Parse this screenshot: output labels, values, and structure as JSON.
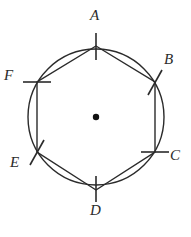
{
  "figure": {
    "kind": "geometry-diagram",
    "canvas": {
      "width": 191,
      "height": 237,
      "background": "#ffffff"
    },
    "stroke_color": "#2b2b2b",
    "circle": {
      "name": "circumscribed-circle",
      "cx": 96,
      "cy": 117,
      "r": 68,
      "stroke_width": 1.4
    },
    "center_point": {
      "name": "center-dot",
      "cx": 96,
      "cy": 117,
      "r": 3.2,
      "fill": "#111111"
    },
    "polygon": {
      "name": "inscribed-hexagon",
      "sides": 6,
      "stroke_width": 1.4,
      "points": "96,46 155,82 155,152 96,190 37,152 37,82"
    },
    "vertices": [
      {
        "id": "A",
        "label": "A",
        "x": 96,
        "y": 46,
        "tick_angle": 90,
        "tick_len": 15,
        "label_x": 90,
        "label_y": 8
      },
      {
        "id": "B",
        "label": "B",
        "x": 155,
        "y": 82,
        "tick_angle": 60,
        "tick_len": 15,
        "label_x": 164,
        "label_y": 52
      },
      {
        "id": "C",
        "label": "C",
        "x": 155,
        "y": 152,
        "tick_angle": 0,
        "tick_len": 15,
        "label_x": 170,
        "label_y": 148
      },
      {
        "id": "D",
        "label": "D",
        "x": 96,
        "y": 190,
        "tick_angle": 90,
        "tick_len": 15,
        "label_x": 90,
        "label_y": 203
      },
      {
        "id": "E",
        "label": "E",
        "x": 37,
        "y": 152,
        "tick_angle": 60,
        "tick_len": 15,
        "label_x": 10,
        "label_y": 155
      },
      {
        "id": "F",
        "label": "F",
        "x": 37,
        "y": 82,
        "tick_angle": 0,
        "tick_len": 15,
        "label_x": 4,
        "label_y": 68
      }
    ],
    "tick_marks": [
      {
        "name": "tick-A",
        "x1": 96,
        "y1": 33,
        "x2": 96,
        "y2": 60
      },
      {
        "name": "tick-B",
        "x1": 162,
        "y1": 70,
        "x2": 148,
        "y2": 95
      },
      {
        "name": "tick-C",
        "x1": 141,
        "y1": 152,
        "x2": 169,
        "y2": 152
      },
      {
        "name": "tick-D",
        "x1": 96,
        "y1": 176,
        "x2": 96,
        "y2": 202
      },
      {
        "name": "tick-E",
        "x1": 44,
        "y1": 140,
        "x2": 30,
        "y2": 165
      },
      {
        "name": "tick-F",
        "x1": 23,
        "y1": 82,
        "x2": 51,
        "y2": 82
      }
    ]
  }
}
